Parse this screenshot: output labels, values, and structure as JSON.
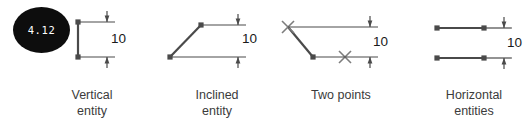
{
  "figure": {
    "callout": {
      "label": "4.12",
      "shape": "filled-ellipse",
      "fill_color": "#0d0d0d",
      "text_color": "#ffffff"
    },
    "ink_color": "#4a4a4a",
    "text_color": "#3b3b3b",
    "background_color": "#ffffff",
    "panels": [
      {
        "id": "vertical-entity",
        "caption": "Vertical\nentity",
        "dimension_value": "10",
        "entity_type": "vertical line",
        "marker_type": "endpoint-dot",
        "markers": 2,
        "dimension_style": "outside-arrows"
      },
      {
        "id": "inclined-entity",
        "caption": "Inclined\nentity",
        "dimension_value": "10",
        "entity_type": "inclined line",
        "marker_type": "endpoint-dot",
        "markers": 2,
        "dimension_style": "outside-arrows"
      },
      {
        "id": "two-points",
        "caption": "Two points",
        "dimension_value": "10",
        "entity_type": "two points",
        "marker_type": "cross",
        "markers": 2,
        "dimension_style": "outside-arrows"
      },
      {
        "id": "horizontal-entities",
        "caption": "Horizontal\nentities",
        "dimension_value": "10",
        "entity_type": "two horizontal lines",
        "marker_type": "endpoint-dot",
        "markers": 4,
        "dimension_style": "outside-arrows"
      }
    ]
  }
}
